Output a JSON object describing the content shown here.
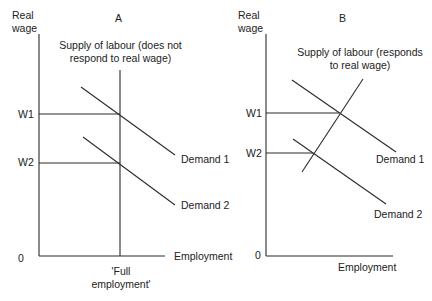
{
  "panels": [
    {
      "id": "A",
      "title": "A",
      "y_axis_label_line1": "Real",
      "y_axis_label_line2": "wage",
      "x_axis_label": "Employment",
      "origin_label": "0",
      "wage_levels": [
        "W1",
        "W2"
      ],
      "supply_label_line1": "Supply of labour (does not",
      "supply_label_line2": "respond to real wage)",
      "demand_labels": [
        "Demand 1",
        "Demand 2"
      ],
      "full_employment_line1": "'Full",
      "full_employment_line2": "employment'"
    },
    {
      "id": "B",
      "title": "B",
      "y_axis_label_line1": "Real",
      "y_axis_label_line2": "wage",
      "x_axis_label": "Employment",
      "origin_label": "0",
      "wage_levels": [
        "W1",
        "W2"
      ],
      "supply_label_line1": "Supply of labour (responds",
      "supply_label_line2": "to real wage)",
      "demand_labels": [
        "Demand 1",
        "Demand 2"
      ]
    }
  ],
  "colors": {
    "line": "#2a2a2a",
    "text": "#222222",
    "background": "#ffffff"
  }
}
